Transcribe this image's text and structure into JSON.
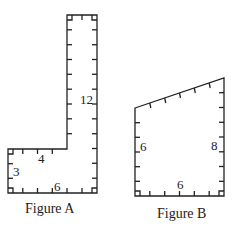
{
  "figures": [
    {
      "caption": "Figure A",
      "labels": {
        "height_right": "12",
        "top_step": "4",
        "left_side": "3",
        "bottom": "6"
      }
    },
    {
      "caption": "Figure B",
      "labels": {
        "left_side": "6",
        "right_side": "8",
        "bottom": "6"
      }
    }
  ],
  "colors": {
    "stroke": "#222222",
    "background": "#ffffff"
  }
}
